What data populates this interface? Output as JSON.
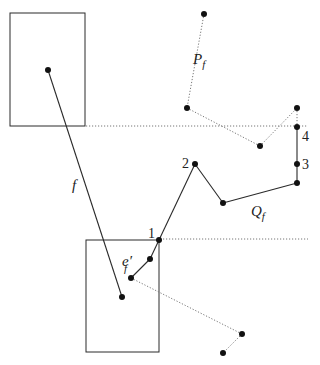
{
  "diagram": {
    "boxes": [
      {
        "id": "box-top",
        "x": 10,
        "y": 13,
        "w": 75,
        "h": 113
      },
      {
        "id": "box-bottom",
        "x": 86,
        "y": 240,
        "w": 73,
        "h": 112
      }
    ],
    "guides": [
      {
        "id": "guide-upper",
        "x1": 86,
        "y1": 126,
        "x2": 308,
        "y2": 126
      },
      {
        "id": "guide-lower",
        "x1": 160,
        "y1": 239,
        "x2": 308,
        "y2": 239
      }
    ],
    "solid_edges": [
      {
        "id": "edge-f",
        "x1": 48,
        "y1": 70,
        "x2": 122,
        "y2": 297
      },
      {
        "id": "edge-q1",
        "x1": 159,
        "y1": 240,
        "x2": 195,
        "y2": 164
      },
      {
        "id": "edge-q2",
        "x1": 195,
        "y1": 164,
        "x2": 223,
        "y2": 203
      },
      {
        "id": "edge-q3",
        "x1": 223,
        "y1": 203,
        "x2": 297,
        "y2": 183
      },
      {
        "id": "edge-q4",
        "x1": 297,
        "y1": 183,
        "x2": 297,
        "y2": 127
      },
      {
        "id": "edge-e1",
        "x1": 159,
        "y1": 240,
        "x2": 150,
        "y2": 259
      },
      {
        "id": "edge-e2",
        "x1": 150,
        "y1": 259,
        "x2": 131,
        "y2": 278
      }
    ],
    "dotted_edges": [
      {
        "id": "edge-p1",
        "x1": 204,
        "y1": 14,
        "x2": 187,
        "y2": 108
      },
      {
        "id": "edge-p2",
        "x1": 187,
        "y1": 108,
        "x2": 260,
        "y2": 146
      },
      {
        "id": "edge-p3",
        "x1": 260,
        "y1": 146,
        "x2": 297,
        "y2": 108
      },
      {
        "id": "edge-p4",
        "x1": 297,
        "y1": 108,
        "x2": 297,
        "y2": 127
      },
      {
        "id": "edge-b1",
        "x1": 131,
        "y1": 278,
        "x2": 242,
        "y2": 334
      },
      {
        "id": "edge-b2",
        "x1": 242,
        "y1": 334,
        "x2": 223,
        "y2": 353
      }
    ],
    "nodes": [
      {
        "x": 48,
        "y": 70
      },
      {
        "x": 122,
        "y": 297
      },
      {
        "x": 204,
        "y": 14
      },
      {
        "x": 187,
        "y": 108
      },
      {
        "x": 260,
        "y": 146
      },
      {
        "x": 297,
        "y": 108
      },
      {
        "x": 297,
        "y": 127
      },
      {
        "x": 297,
        "y": 164
      },
      {
        "x": 297,
        "y": 183
      },
      {
        "x": 223,
        "y": 203
      },
      {
        "x": 195,
        "y": 164
      },
      {
        "x": 159,
        "y": 240
      },
      {
        "x": 150,
        "y": 259
      },
      {
        "x": 131,
        "y": 278
      },
      {
        "x": 242,
        "y": 334
      },
      {
        "x": 223,
        "y": 353
      }
    ],
    "labels": {
      "f": "f",
      "P": "P",
      "P_sub": "f",
      "Q": "Q",
      "Q_sub": "f",
      "e": "e′",
      "e_sub": "f",
      "n1": "1",
      "n2": "2",
      "n3": "3",
      "n4": "4"
    },
    "colors": {
      "stroke": "#2a2a2a",
      "dotted": "#777777",
      "node": "#111111"
    }
  }
}
